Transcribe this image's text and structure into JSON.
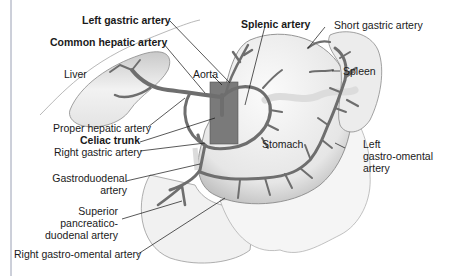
{
  "diagram": {
    "labels": {
      "left_gastric": "Left gastric artery",
      "common_hepatic": "Common hepatic artery",
      "splenic": "Splenic artery",
      "short_gastric": "Short gastric artery",
      "liver": "Liver",
      "aorta": "Aorta",
      "spleen": "Spleen",
      "proper_hepatic": "Proper hepatic artery",
      "celiac_trunk": "Celiac trunk",
      "right_gastric": "Right gastric artery",
      "stomach": "Stomach",
      "left_gastro_omental_1": "Left",
      "left_gastro_omental_2": "gastro-omental",
      "left_gastro_omental_3": "artery",
      "gastroduodenal_1": "Gastroduodenal",
      "gastroduodenal_2": "artery",
      "sup_pancreatico_1": "Superior",
      "sup_pancreatico_2": "pancreatico-",
      "sup_pancreatico_3": "duodenal artery",
      "right_gastro_omental": "Right gastro-omental artery"
    },
    "colors": {
      "artery": "#6e6e6e",
      "artery_edge": "#4a4a4a",
      "aorta": "#7a7a7a",
      "organ_fill": "#efefef",
      "organ_edge": "#8a8a8a",
      "leader": "#111111",
      "border": "#9aa0b4"
    }
  }
}
